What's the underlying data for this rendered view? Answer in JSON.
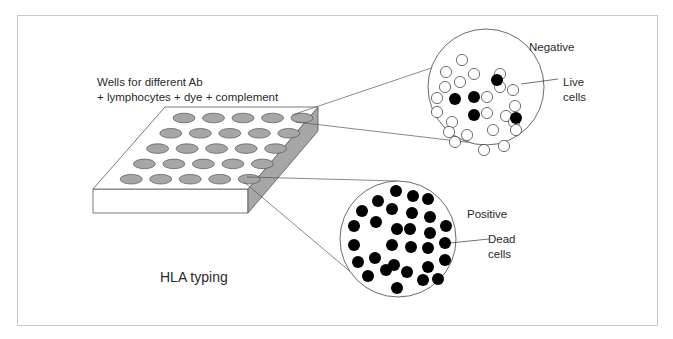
{
  "figure": {
    "title": "HLA typing",
    "wells_label_line1": "Wells for different Ab",
    "wells_label_line2": "+ lymphocytes + dye + complement",
    "plate": {
      "rows": 5,
      "cols": 5,
      "well_fill": "#a6a6a6",
      "side_fill": "#a6a6a6"
    },
    "negative": {
      "label": "Negative",
      "annotation_line1": "Live",
      "annotation_line2": "cells",
      "center": [
        486,
        87
      ],
      "radius": 58,
      "live_cells": [
        [
          462,
          60
        ],
        [
          446,
          72
        ],
        [
          474,
          74
        ],
        [
          445,
          87
        ],
        [
          460,
          82
        ],
        [
          500,
          74
        ],
        [
          500,
          87
        ],
        [
          437,
          98
        ],
        [
          487,
          97
        ],
        [
          513,
          90
        ],
        [
          437,
          112
        ],
        [
          487,
          113
        ],
        [
          515,
          106
        ],
        [
          452,
          122
        ],
        [
          506,
          116
        ],
        [
          514,
          122
        ],
        [
          449,
          132
        ],
        [
          467,
          135
        ],
        [
          493,
          130
        ],
        [
          516,
          130
        ],
        [
          455,
          142
        ],
        [
          484,
          150
        ],
        [
          504,
          146
        ]
      ],
      "dead_cells": [
        [
          497,
          80
        ],
        [
          455,
          99
        ],
        [
          474,
          97
        ],
        [
          474,
          115
        ],
        [
          516,
          118
        ]
      ]
    },
    "positive": {
      "label": "Positive",
      "annotation_line1": "Dead",
      "annotation_line2": "cells",
      "center": [
        398,
        239
      ],
      "radius": 58,
      "dead_cells": [
        [
          396,
          191
        ],
        [
          378,
          201
        ],
        [
          413,
          196
        ],
        [
          428,
          199
        ],
        [
          362,
          211
        ],
        [
          392,
          209
        ],
        [
          412,
          213
        ],
        [
          430,
          217
        ],
        [
          354,
          226
        ],
        [
          376,
          222
        ],
        [
          397,
          229
        ],
        [
          410,
          229
        ],
        [
          430,
          233
        ],
        [
          446,
          226
        ],
        [
          354,
          245
        ],
        [
          392,
          245
        ],
        [
          411,
          247
        ],
        [
          428,
          248
        ],
        [
          445,
          243
        ],
        [
          358,
          262
        ],
        [
          375,
          258
        ],
        [
          394,
          265
        ],
        [
          428,
          267
        ],
        [
          445,
          260
        ],
        [
          368,
          276
        ],
        [
          386,
          270
        ],
        [
          407,
          272
        ],
        [
          423,
          280
        ],
        [
          397,
          288
        ],
        [
          438,
          279
        ]
      ]
    }
  }
}
